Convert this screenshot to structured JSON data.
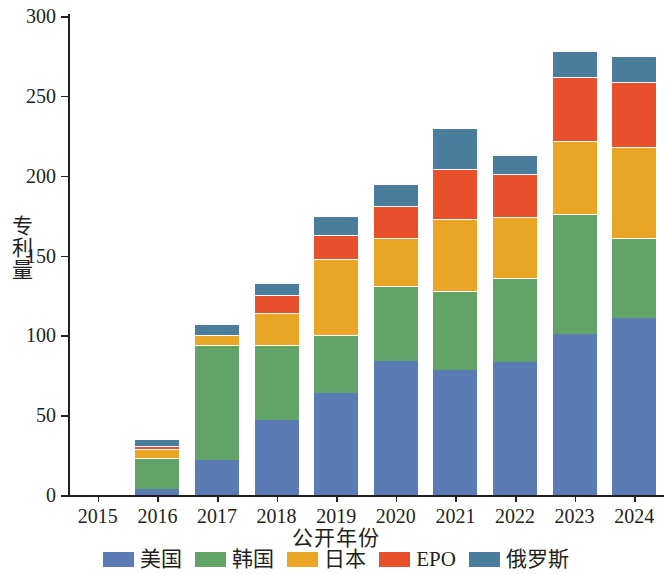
{
  "chart_data": {
    "type": "bar",
    "stacked": true,
    "title": "",
    "xlabel": "公开年份",
    "ylabel": "专利量",
    "categories": [
      "2015",
      "2016",
      "2017",
      "2018",
      "2019",
      "2020",
      "2021",
      "2022",
      "2023",
      "2024"
    ],
    "ylim": [
      0,
      300
    ],
    "yticks": [
      0,
      50,
      100,
      150,
      200,
      250,
      300
    ],
    "grid": false,
    "legend_position": "bottom",
    "series": [
      {
        "name": "美国",
        "color": "#5b7bb4",
        "values": [
          0,
          4,
          22,
          47,
          64,
          84,
          78,
          83,
          101,
          111
        ]
      },
      {
        "name": "韩国",
        "color": "#62a368",
        "values": [
          0,
          19,
          72,
          47,
          36,
          47,
          50,
          53,
          75,
          50
        ]
      },
      {
        "name": "日本",
        "color": "#e9a526",
        "values": [
          0,
          6,
          6,
          20,
          48,
          30,
          45,
          38,
          46,
          57
        ]
      },
      {
        "name": "EPO",
        "color": "#e8502b",
        "values": [
          0,
          2,
          0,
          11,
          15,
          20,
          31,
          27,
          40,
          41
        ]
      },
      {
        "name": "俄罗斯",
        "color": "#4a7d9b",
        "values": [
          0,
          4,
          7,
          8,
          12,
          14,
          26,
          12,
          16,
          16
        ]
      }
    ],
    "totals": [
      0,
      35,
      107,
      133,
      175,
      195,
      230,
      213,
      278,
      275
    ]
  }
}
